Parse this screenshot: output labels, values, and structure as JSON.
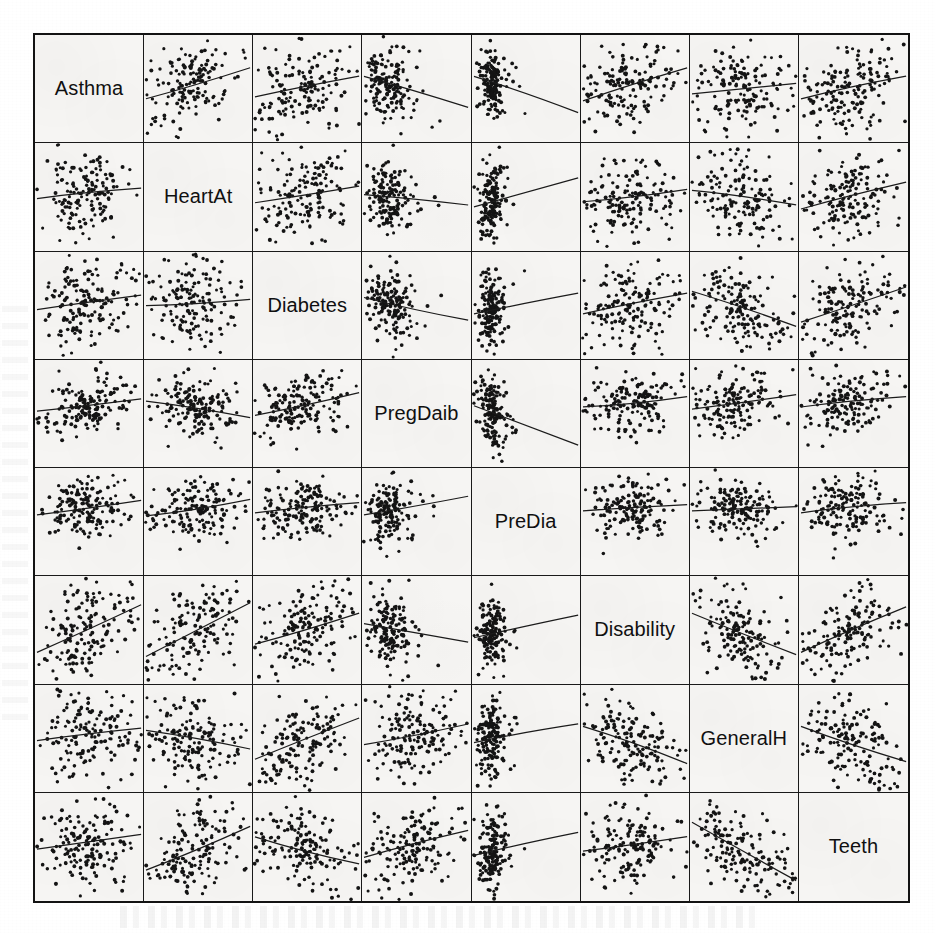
{
  "figure": {
    "type": "scatterplot-matrix",
    "title": "",
    "variables": [
      "Asthma",
      "HeartAt",
      "Diabetes",
      "PregDaib",
      "PreDia",
      "Disability",
      "GeneralH",
      "Teeth"
    ],
    "n_rows": 8,
    "n_cols": 8,
    "diagonal_style": "variable-name-label",
    "points_per_cell": 165,
    "point_color": "#141414",
    "line_color": "#1b1b1b",
    "panel_background": "#f6f5f3",
    "border_color": "#131313",
    "page_background": "#ffffff"
  },
  "chart_data": {
    "type": "scatter",
    "title": "",
    "xlabel": "",
    "ylabel": "",
    "variables": [
      "Asthma",
      "HeartAt",
      "Diabetes",
      "PregDaib",
      "PreDia",
      "Disability",
      "GeneralH",
      "Teeth"
    ],
    "diagonal_labels": [
      "Asthma",
      "HeartAt",
      "Diabetes",
      "PregDaib",
      "PreDia",
      "Disability",
      "GeneralH",
      "Teeth"
    ],
    "grid": false,
    "legend": "none",
    "xlim": [
      0,
      1
    ],
    "ylim": [
      0,
      1
    ],
    "panels": [
      {
        "row": 0,
        "col": 1,
        "x": "HeartAt",
        "y": "Asthma",
        "slope": 0.3,
        "intercept": 0.4,
        "cluster": "center-left",
        "spread": 0.22
      },
      {
        "row": 0,
        "col": 2,
        "x": "Diabetes",
        "y": "Asthma",
        "slope": 0.2,
        "intercept": 0.42,
        "cluster": "center",
        "spread": 0.23
      },
      {
        "row": 0,
        "col": 3,
        "x": "PregDaib",
        "y": "Asthma",
        "slope": -0.3,
        "intercept": 0.62,
        "cluster": "left",
        "spread": 0.18
      },
      {
        "row": 0,
        "col": 4,
        "x": "PreDia",
        "y": "Asthma",
        "slope": -0.35,
        "intercept": 0.62,
        "cluster": "left-tight",
        "spread": 0.14
      },
      {
        "row": 0,
        "col": 5,
        "x": "Disability",
        "y": "Asthma",
        "slope": 0.32,
        "intercept": 0.38,
        "cluster": "center",
        "spread": 0.22
      },
      {
        "row": 0,
        "col": 6,
        "x": "GeneralH",
        "y": "Asthma",
        "slope": 0.1,
        "intercept": 0.45,
        "cluster": "center",
        "spread": 0.23
      },
      {
        "row": 0,
        "col": 7,
        "x": "Teeth",
        "y": "Asthma",
        "slope": 0.22,
        "intercept": 0.4,
        "cluster": "center",
        "spread": 0.23
      },
      {
        "row": 1,
        "col": 0,
        "x": "Asthma",
        "y": "HeartAt",
        "slope": 0.1,
        "intercept": 0.48,
        "cluster": "center",
        "spread": 0.22
      },
      {
        "row": 1,
        "col": 2,
        "x": "Diabetes",
        "y": "HeartAt",
        "slope": 0.16,
        "intercept": 0.44,
        "cluster": "center",
        "spread": 0.22
      },
      {
        "row": 1,
        "col": 3,
        "x": "PregDaib",
        "y": "HeartAt",
        "slope": -0.1,
        "intercept": 0.52,
        "cluster": "left",
        "spread": 0.18
      },
      {
        "row": 1,
        "col": 4,
        "x": "PreDia",
        "y": "HeartAt",
        "slope": 0.28,
        "intercept": 0.4,
        "cluster": "left-tight",
        "spread": 0.15
      },
      {
        "row": 1,
        "col": 5,
        "x": "Disability",
        "y": "HeartAt",
        "slope": 0.12,
        "intercept": 0.45,
        "cluster": "center",
        "spread": 0.22
      },
      {
        "row": 1,
        "col": 6,
        "x": "GeneralH",
        "y": "HeartAt",
        "slope": -0.14,
        "intercept": 0.56,
        "cluster": "center",
        "spread": 0.22
      },
      {
        "row": 1,
        "col": 7,
        "x": "Teeth",
        "y": "HeartAt",
        "slope": 0.26,
        "intercept": 0.38,
        "cluster": "center",
        "spread": 0.22
      },
      {
        "row": 2,
        "col": 0,
        "x": "Asthma",
        "y": "Diabetes",
        "slope": 0.14,
        "intercept": 0.46,
        "cluster": "center",
        "spread": 0.23
      },
      {
        "row": 2,
        "col": 1,
        "x": "HeartAt",
        "y": "Diabetes",
        "slope": 0.06,
        "intercept": 0.5,
        "cluster": "center",
        "spread": 0.21
      },
      {
        "row": 2,
        "col": 3,
        "x": "PregDaib",
        "y": "Diabetes",
        "slope": -0.22,
        "intercept": 0.58,
        "cluster": "left",
        "spread": 0.18
      },
      {
        "row": 2,
        "col": 4,
        "x": "PreDia",
        "y": "Diabetes",
        "slope": 0.2,
        "intercept": 0.42,
        "cluster": "left-tight",
        "spread": 0.15
      },
      {
        "row": 2,
        "col": 5,
        "x": "Disability",
        "y": "Diabetes",
        "slope": 0.2,
        "intercept": 0.42,
        "cluster": "center",
        "spread": 0.22
      },
      {
        "row": 2,
        "col": 6,
        "x": "GeneralH",
        "y": "Diabetes",
        "slope": -0.34,
        "intercept": 0.64,
        "cluster": "center",
        "spread": 0.22
      },
      {
        "row": 2,
        "col": 7,
        "x": "Teeth",
        "y": "Diabetes",
        "slope": 0.34,
        "intercept": 0.34,
        "cluster": "center",
        "spread": 0.22
      },
      {
        "row": 3,
        "col": 0,
        "x": "Asthma",
        "y": "PregDaib",
        "slope": 0.12,
        "intercept": 0.52,
        "cluster": "center-low",
        "spread": 0.2
      },
      {
        "row": 3,
        "col": 1,
        "x": "HeartAt",
        "y": "PregDaib",
        "slope": -0.16,
        "intercept": 0.62,
        "cluster": "center-low",
        "spread": 0.2
      },
      {
        "row": 3,
        "col": 2,
        "x": "Diabetes",
        "y": "PregDaib",
        "slope": 0.22,
        "intercept": 0.48,
        "cluster": "center-low",
        "spread": 0.2
      },
      {
        "row": 3,
        "col": 4,
        "x": "PreDia",
        "y": "PregDaib",
        "slope": -0.38,
        "intercept": 0.58,
        "cluster": "left-tight",
        "spread": 0.14
      },
      {
        "row": 3,
        "col": 5,
        "x": "Disability",
        "y": "PregDaib",
        "slope": 0.1,
        "intercept": 0.56,
        "cluster": "center-low",
        "spread": 0.2
      },
      {
        "row": 3,
        "col": 6,
        "x": "GeneralH",
        "y": "PregDaib",
        "slope": 0.14,
        "intercept": 0.54,
        "cluster": "center-low",
        "spread": 0.2
      },
      {
        "row": 3,
        "col": 7,
        "x": "Teeth",
        "y": "PregDaib",
        "slope": 0.1,
        "intercept": 0.56,
        "cluster": "center-low",
        "spread": 0.2
      },
      {
        "row": 4,
        "col": 0,
        "x": "Asthma",
        "y": "PreDia",
        "slope": 0.14,
        "intercept": 0.56,
        "cluster": "center-low",
        "spread": 0.19
      },
      {
        "row": 4,
        "col": 1,
        "x": "HeartAt",
        "y": "PreDia",
        "slope": 0.16,
        "intercept": 0.55,
        "cluster": "center-low",
        "spread": 0.19
      },
      {
        "row": 4,
        "col": 2,
        "x": "Diabetes",
        "y": "PreDia",
        "slope": 0.1,
        "intercept": 0.58,
        "cluster": "center-low",
        "spread": 0.19
      },
      {
        "row": 4,
        "col": 3,
        "x": "PregDaib",
        "y": "PreDia",
        "slope": 0.18,
        "intercept": 0.56,
        "cluster": "left",
        "spread": 0.17
      },
      {
        "row": 4,
        "col": 5,
        "x": "Disability",
        "y": "PreDia",
        "slope": 0.06,
        "intercept": 0.6,
        "cluster": "center-low",
        "spread": 0.19
      },
      {
        "row": 4,
        "col": 6,
        "x": "GeneralH",
        "y": "PreDia",
        "slope": 0.04,
        "intercept": 0.6,
        "cluster": "center-low",
        "spread": 0.19
      },
      {
        "row": 4,
        "col": 7,
        "x": "Teeth",
        "y": "PreDia",
        "slope": 0.1,
        "intercept": 0.58,
        "cluster": "center-low",
        "spread": 0.19
      },
      {
        "row": 5,
        "col": 0,
        "x": "Asthma",
        "y": "Disability",
        "slope": 0.46,
        "intercept": 0.28,
        "cluster": "center",
        "spread": 0.22
      },
      {
        "row": 5,
        "col": 1,
        "x": "HeartAt",
        "y": "Disability",
        "slope": 0.52,
        "intercept": 0.24,
        "cluster": "center",
        "spread": 0.22
      },
      {
        "row": 5,
        "col": 2,
        "x": "Diabetes",
        "y": "Disability",
        "slope": 0.3,
        "intercept": 0.36,
        "cluster": "center",
        "spread": 0.22
      },
      {
        "row": 5,
        "col": 3,
        "x": "PregDaib",
        "y": "Disability",
        "slope": -0.18,
        "intercept": 0.56,
        "cluster": "left",
        "spread": 0.18
      },
      {
        "row": 5,
        "col": 4,
        "x": "PreDia",
        "y": "Disability",
        "slope": 0.22,
        "intercept": 0.42,
        "cluster": "left-tight",
        "spread": 0.15
      },
      {
        "row": 5,
        "col": 6,
        "x": "GeneralH",
        "y": "Disability",
        "slope": -0.4,
        "intercept": 0.66,
        "cluster": "center",
        "spread": 0.22
      },
      {
        "row": 5,
        "col": 7,
        "x": "Teeth",
        "y": "Disability",
        "slope": 0.44,
        "intercept": 0.28,
        "cluster": "center",
        "spread": 0.22
      },
      {
        "row": 6,
        "col": 0,
        "x": "Asthma",
        "y": "GeneralH",
        "slope": 0.12,
        "intercept": 0.48,
        "cluster": "center",
        "spread": 0.22
      },
      {
        "row": 6,
        "col": 1,
        "x": "HeartAt",
        "y": "GeneralH",
        "slope": -0.18,
        "intercept": 0.58,
        "cluster": "center",
        "spread": 0.22
      },
      {
        "row": 6,
        "col": 2,
        "x": "Diabetes",
        "y": "GeneralH",
        "slope": 0.4,
        "intercept": 0.3,
        "cluster": "center",
        "spread": 0.22
      },
      {
        "row": 6,
        "col": 3,
        "x": "PregDaib",
        "y": "GeneralH",
        "slope": 0.2,
        "intercept": 0.44,
        "cluster": "center",
        "spread": 0.21
      },
      {
        "row": 6,
        "col": 4,
        "x": "PreDia",
        "y": "GeneralH",
        "slope": 0.18,
        "intercept": 0.46,
        "cluster": "left-tight",
        "spread": 0.16
      },
      {
        "row": 6,
        "col": 5,
        "x": "Disability",
        "y": "GeneralH",
        "slope": -0.36,
        "intercept": 0.62,
        "cluster": "center",
        "spread": 0.22
      },
      {
        "row": 6,
        "col": 7,
        "x": "Teeth",
        "y": "GeneralH",
        "slope": -0.34,
        "intercept": 0.62,
        "cluster": "center",
        "spread": 0.22
      },
      {
        "row": 7,
        "col": 0,
        "x": "Asthma",
        "y": "Teeth",
        "slope": 0.14,
        "intercept": 0.48,
        "cluster": "center",
        "spread": 0.22
      },
      {
        "row": 7,
        "col": 1,
        "x": "HeartAt",
        "y": "Teeth",
        "slope": 0.42,
        "intercept": 0.28,
        "cluster": "center",
        "spread": 0.22
      },
      {
        "row": 7,
        "col": 2,
        "x": "Diabetes",
        "y": "Teeth",
        "slope": -0.26,
        "intercept": 0.6,
        "cluster": "center",
        "spread": 0.22
      },
      {
        "row": 7,
        "col": 3,
        "x": "PregDaib",
        "y": "Teeth",
        "slope": 0.26,
        "intercept": 0.4,
        "cluster": "center",
        "spread": 0.21
      },
      {
        "row": 7,
        "col": 4,
        "x": "PreDia",
        "y": "Teeth",
        "slope": 0.22,
        "intercept": 0.42,
        "cluster": "left-tight",
        "spread": 0.16
      },
      {
        "row": 7,
        "col": 5,
        "x": "Disability",
        "y": "Teeth",
        "slope": 0.14,
        "intercept": 0.46,
        "cluster": "center",
        "spread": 0.22
      },
      {
        "row": 7,
        "col": 6,
        "x": "GeneralH",
        "y": "Teeth",
        "slope": -0.56,
        "intercept": 0.74,
        "cluster": "center",
        "spread": 0.22
      }
    ]
  }
}
